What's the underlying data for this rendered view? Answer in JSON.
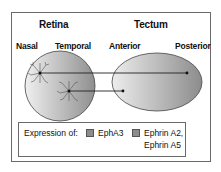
{
  "titles": {
    "retina": "Retina",
    "tectum": "Tectum"
  },
  "axis_labels": {
    "nasal": "Nasal",
    "temporal": "Temporal",
    "anterior": "Anterior",
    "posterior": "Posterior"
  },
  "legend": {
    "prefix": "Expression of:",
    "items": [
      {
        "label": "EphA3",
        "color": "#8c8c8c"
      },
      {
        "label_line1": "Ephrin A2,",
        "label_line2": "Ephrin A5",
        "color": "#8c8c8c"
      }
    ]
  },
  "colors": {
    "border": "#6a6a6a",
    "gradient_dark": "#9a9a9a",
    "gradient_light": "#f2f2f2",
    "line": "#222222"
  },
  "projections": [
    {
      "from": "nasal-neuron",
      "to": "posterior-tectum"
    },
    {
      "from": "temporal-neuron",
      "to": "anterior-tectum"
    }
  ]
}
